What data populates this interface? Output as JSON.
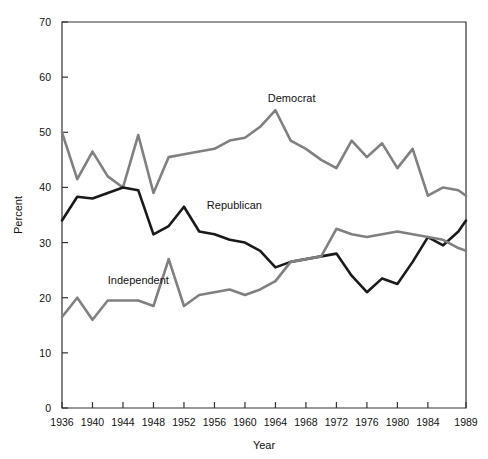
{
  "chart_data": {
    "type": "line",
    "title": "",
    "xlabel": "Year",
    "ylabel": "Percent",
    "xlim": [
      1936,
      1989
    ],
    "ylim": [
      0,
      70
    ],
    "grid": false,
    "legend_position": "inline-annotations",
    "xticks": [
      1936,
      1940,
      1944,
      1948,
      1952,
      1956,
      1960,
      1964,
      1968,
      1972,
      1976,
      1980,
      1984,
      1989
    ],
    "xtick_labels": [
      "1936",
      "1940",
      "1944",
      "1948",
      "1952",
      "1956",
      "1960",
      "1964",
      "1968",
      "1972",
      "1976",
      "1980",
      "1984",
      "1989"
    ],
    "yticks": [
      0,
      10,
      20,
      30,
      40,
      50,
      60,
      70
    ],
    "ytick_labels": [
      "0",
      "10",
      "20",
      "30",
      "40",
      "50",
      "60",
      "70"
    ],
    "series": [
      {
        "name": "Democrat",
        "color": "#808080",
        "label_x": 1963,
        "label_y": 55.5,
        "x": [
          1936,
          1938,
          1940,
          1942,
          1944,
          1946,
          1948,
          1950,
          1952,
          1954,
          1956,
          1958,
          1960,
          1962,
          1964,
          1966,
          1968,
          1970,
          1972,
          1974,
          1976,
          1978,
          1980,
          1982,
          1984,
          1986,
          1988,
          1989
        ],
        "values": [
          50.0,
          41.5,
          46.5,
          42.0,
          40.0,
          49.5,
          39.0,
          45.5,
          46.0,
          46.5,
          47.0,
          48.5,
          49.0,
          51.0,
          54.0,
          48.5,
          47.0,
          45.0,
          43.5,
          48.5,
          45.5,
          48.0,
          43.5,
          47.0,
          38.5,
          40.0,
          39.5,
          38.5
        ]
      },
      {
        "name": "Republican",
        "color": "#1a1a1a",
        "label_x": 1955,
        "label_y": 36.0,
        "x": [
          1936,
          1938,
          1940,
          1942,
          1944,
          1946,
          1948,
          1950,
          1952,
          1954,
          1956,
          1958,
          1960,
          1962,
          1964,
          1966,
          1968,
          1970,
          1972,
          1974,
          1976,
          1978,
          1980,
          1982,
          1984,
          1986,
          1988,
          1989
        ],
        "values": [
          34.0,
          38.3,
          38.0,
          39.0,
          40.0,
          39.5,
          31.5,
          33.0,
          36.5,
          32.0,
          31.5,
          30.5,
          30.0,
          28.5,
          25.5,
          26.5,
          27.0,
          27.5,
          28.0,
          24.0,
          21.0,
          23.5,
          22.5,
          26.5,
          31.0,
          29.5,
          32.0,
          34.0
        ]
      },
      {
        "name": "Independent",
        "color": "#808080",
        "label_x": 1942,
        "label_y": 22.5,
        "x": [
          1936,
          1938,
          1940,
          1942,
          1944,
          1946,
          1948,
          1950,
          1952,
          1954,
          1956,
          1958,
          1960,
          1962,
          1964,
          1966,
          1968,
          1970,
          1972,
          1974,
          1976,
          1978,
          1980,
          1982,
          1984,
          1986,
          1988,
          1989
        ],
        "values": [
          16.5,
          20.0,
          16.0,
          19.5,
          19.5,
          19.5,
          18.5,
          27.0,
          18.5,
          20.5,
          21.0,
          21.5,
          20.5,
          21.5,
          23.0,
          26.5,
          27.0,
          27.5,
          32.5,
          31.5,
          31.0,
          31.5,
          32.0,
          31.5,
          31.0,
          30.5,
          29.0,
          28.5
        ]
      }
    ]
  }
}
